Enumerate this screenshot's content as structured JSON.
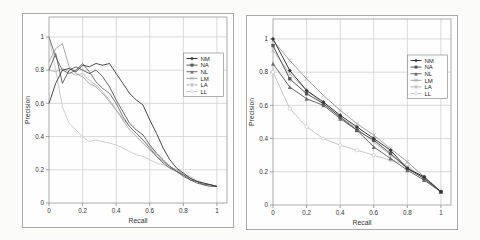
{
  "figure": {
    "background": "#fbfbfa",
    "panel_border_color": "#a8a8a8",
    "grid_color": "#c9c9c9",
    "frame_color": "#9a9a9a",
    "tick_color": "#8a8a8a",
    "text_color": "#333333",
    "legend_border_color": "#8f8f8f"
  },
  "chart_data": [
    {
      "id": "left-pr-chart",
      "type": "line",
      "title": "",
      "xlabel": "Recall",
      "ylabel": "Precision",
      "xlim": [
        0,
        1.06
      ],
      "ylim": [
        0,
        1.12
      ],
      "xticks": [
        0,
        0.2,
        0.4,
        0.6,
        0.8,
        1
      ],
      "yticks": [
        0,
        0.2,
        0.4,
        0.6,
        0.8,
        1
      ],
      "xtick_labels": [
        "0",
        "0.2",
        "0.4",
        "0.6",
        "0.8",
        "1"
      ],
      "ytick_labels": [
        "0",
        "0.2",
        "0.4",
        "0.6",
        "0.8",
        "1"
      ],
      "grid": true,
      "point_markers": false,
      "legend_position": "inside-right-upper",
      "series": [
        {
          "name": "NM",
          "color": "#383838",
          "marker": "diamond",
          "points": [
            [
              0,
              0.6
            ],
            [
              0.04,
              0.72
            ],
            [
              0.08,
              0.8
            ],
            [
              0.12,
              0.81
            ],
            [
              0.16,
              0.79
            ],
            [
              0.2,
              0.83
            ],
            [
              0.24,
              0.82
            ],
            [
              0.28,
              0.84
            ],
            [
              0.32,
              0.83
            ],
            [
              0.36,
              0.84
            ],
            [
              0.4,
              0.78
            ],
            [
              0.44,
              0.72
            ],
            [
              0.48,
              0.66
            ],
            [
              0.52,
              0.62
            ],
            [
              0.56,
              0.59
            ],
            [
              0.6,
              0.5
            ],
            [
              0.64,
              0.42
            ],
            [
              0.68,
              0.33
            ],
            [
              0.72,
              0.26
            ],
            [
              0.76,
              0.21
            ],
            [
              0.8,
              0.18
            ],
            [
              0.84,
              0.15
            ],
            [
              0.88,
              0.13
            ],
            [
              0.92,
              0.12
            ],
            [
              0.96,
              0.11
            ],
            [
              1,
              0.1
            ]
          ]
        },
        {
          "name": "NA",
          "color": "#575757",
          "marker": "square",
          "points": [
            [
              0,
              0.8
            ],
            [
              0.04,
              0.9
            ],
            [
              0.08,
              0.72
            ],
            [
              0.12,
              0.8
            ],
            [
              0.16,
              0.82
            ],
            [
              0.2,
              0.8
            ],
            [
              0.24,
              0.78
            ],
            [
              0.28,
              0.8
            ],
            [
              0.32,
              0.76
            ],
            [
              0.36,
              0.7
            ],
            [
              0.4,
              0.62
            ],
            [
              0.44,
              0.55
            ],
            [
              0.48,
              0.48
            ],
            [
              0.52,
              0.44
            ],
            [
              0.56,
              0.41
            ],
            [
              0.6,
              0.35
            ],
            [
              0.64,
              0.3
            ],
            [
              0.68,
              0.26
            ],
            [
              0.72,
              0.22
            ],
            [
              0.76,
              0.19
            ],
            [
              0.8,
              0.17
            ],
            [
              0.84,
              0.14
            ],
            [
              0.88,
              0.13
            ],
            [
              0.92,
              0.11
            ],
            [
              0.96,
              0.11
            ],
            [
              1,
              0.1
            ]
          ]
        },
        {
          "name": "NL",
          "color": "#6b6b6b",
          "marker": "triangle",
          "points": [
            [
              0,
              1.0
            ],
            [
              0.04,
              0.88
            ],
            [
              0.08,
              0.8
            ],
            [
              0.12,
              0.78
            ],
            [
              0.16,
              0.8
            ],
            [
              0.2,
              0.84
            ],
            [
              0.24,
              0.79
            ],
            [
              0.28,
              0.73
            ],
            [
              0.32,
              0.69
            ],
            [
              0.36,
              0.66
            ],
            [
              0.4,
              0.6
            ],
            [
              0.44,
              0.52
            ],
            [
              0.48,
              0.46
            ],
            [
              0.52,
              0.42
            ],
            [
              0.56,
              0.38
            ],
            [
              0.6,
              0.33
            ],
            [
              0.64,
              0.28
            ],
            [
              0.68,
              0.24
            ],
            [
              0.72,
              0.21
            ],
            [
              0.76,
              0.19
            ],
            [
              0.8,
              0.16
            ],
            [
              0.84,
              0.14
            ],
            [
              0.88,
              0.12
            ],
            [
              0.92,
              0.11
            ],
            [
              0.96,
              0.1
            ],
            [
              1,
              0.1
            ]
          ]
        },
        {
          "name": "LM",
          "color": "#a2a2a2",
          "marker": "x",
          "points": [
            [
              0,
              0.85
            ],
            [
              0.04,
              0.93
            ],
            [
              0.08,
              0.96
            ],
            [
              0.12,
              0.82
            ],
            [
              0.16,
              0.78
            ],
            [
              0.2,
              0.76
            ],
            [
              0.24,
              0.72
            ],
            [
              0.28,
              0.7
            ],
            [
              0.32,
              0.66
            ],
            [
              0.36,
              0.61
            ],
            [
              0.4,
              0.56
            ],
            [
              0.44,
              0.5
            ],
            [
              0.48,
              0.44
            ],
            [
              0.52,
              0.4
            ],
            [
              0.56,
              0.36
            ],
            [
              0.6,
              0.32
            ],
            [
              0.64,
              0.28
            ],
            [
              0.68,
              0.25
            ],
            [
              0.72,
              0.22
            ],
            [
              0.76,
              0.2
            ],
            [
              0.8,
              0.17
            ],
            [
              0.84,
              0.15
            ],
            [
              0.88,
              0.13
            ],
            [
              0.92,
              0.12
            ],
            [
              0.96,
              0.11
            ],
            [
              1,
              0.1
            ]
          ]
        },
        {
          "name": "LA",
          "color": "#b5b5b5",
          "marker": "asterisk",
          "points": [
            [
              0,
              0.8
            ],
            [
              0.04,
              0.79
            ],
            [
              0.08,
              0.81
            ],
            [
              0.12,
              0.79
            ],
            [
              0.16,
              0.77
            ],
            [
              0.2,
              0.78
            ],
            [
              0.24,
              0.74
            ],
            [
              0.28,
              0.71
            ],
            [
              0.32,
              0.67
            ],
            [
              0.36,
              0.62
            ],
            [
              0.4,
              0.56
            ],
            [
              0.44,
              0.51
            ],
            [
              0.48,
              0.46
            ],
            [
              0.52,
              0.42
            ],
            [
              0.56,
              0.38
            ],
            [
              0.6,
              0.34
            ],
            [
              0.64,
              0.29
            ],
            [
              0.68,
              0.25
            ],
            [
              0.72,
              0.22
            ],
            [
              0.76,
              0.19
            ],
            [
              0.8,
              0.17
            ],
            [
              0.84,
              0.15
            ],
            [
              0.88,
              0.13
            ],
            [
              0.92,
              0.11
            ],
            [
              0.96,
              0.1
            ],
            [
              1,
              0.1
            ]
          ]
        },
        {
          "name": "LL",
          "color": "#c9c9c9",
          "marker": "circle",
          "points": [
            [
              0,
              1.0
            ],
            [
              0.04,
              0.8
            ],
            [
              0.08,
              0.58
            ],
            [
              0.12,
              0.48
            ],
            [
              0.16,
              0.44
            ],
            [
              0.2,
              0.4
            ],
            [
              0.24,
              0.37
            ],
            [
              0.28,
              0.38
            ],
            [
              0.32,
              0.37
            ],
            [
              0.36,
              0.36
            ],
            [
              0.4,
              0.35
            ],
            [
              0.44,
              0.33
            ],
            [
              0.48,
              0.31
            ],
            [
              0.52,
              0.29
            ],
            [
              0.56,
              0.28
            ],
            [
              0.6,
              0.26
            ],
            [
              0.64,
              0.24
            ],
            [
              0.68,
              0.23
            ],
            [
              0.72,
              0.21
            ],
            [
              0.76,
              0.2
            ],
            [
              0.8,
              0.18
            ],
            [
              0.84,
              0.16
            ],
            [
              0.88,
              0.14
            ],
            [
              0.92,
              0.12
            ],
            [
              0.96,
              0.11
            ],
            [
              1,
              0.1
            ]
          ]
        }
      ]
    },
    {
      "id": "right-pr-chart",
      "type": "line",
      "title": "",
      "xlabel": "Recall",
      "ylabel": "Precision",
      "xlim": [
        0,
        1.06
      ],
      "ylim": [
        0,
        1.12
      ],
      "xticks": [
        0,
        0.2,
        0.4,
        0.6,
        0.8,
        1
      ],
      "yticks": [
        0,
        0.2,
        0.4,
        0.6,
        0.8,
        1
      ],
      "xtick_labels": [
        "0",
        "0.2",
        "0.4",
        "0.6",
        "0.8",
        "1"
      ],
      "ytick_labels": [
        "0",
        "0.2",
        "0.4",
        "0.6",
        "0.8",
        "1"
      ],
      "grid": true,
      "point_markers": true,
      "legend_position": "inside-right-upper",
      "series": [
        {
          "name": "NM",
          "color": "#383838",
          "marker": "diamond",
          "points": [
            [
              0,
              1.0
            ],
            [
              0.1,
              0.81
            ],
            [
              0.2,
              0.69
            ],
            [
              0.3,
              0.62
            ],
            [
              0.4,
              0.54
            ],
            [
              0.5,
              0.47
            ],
            [
              0.6,
              0.4
            ],
            [
              0.7,
              0.33
            ],
            [
              0.8,
              0.22
            ],
            [
              0.9,
              0.17
            ],
            [
              1,
              0.08
            ]
          ]
        },
        {
          "name": "NA",
          "color": "#575757",
          "marker": "square",
          "points": [
            [
              0,
              0.96
            ],
            [
              0.1,
              0.76
            ],
            [
              0.2,
              0.67
            ],
            [
              0.3,
              0.61
            ],
            [
              0.4,
              0.53
            ],
            [
              0.5,
              0.45
            ],
            [
              0.6,
              0.39
            ],
            [
              0.7,
              0.31
            ],
            [
              0.8,
              0.22
            ],
            [
              0.9,
              0.16
            ],
            [
              1,
              0.08
            ]
          ]
        },
        {
          "name": "NL",
          "color": "#6b6b6b",
          "marker": "triangle",
          "points": [
            [
              0,
              0.85
            ],
            [
              0.1,
              0.71
            ],
            [
              0.2,
              0.64
            ],
            [
              0.3,
              0.6
            ],
            [
              0.4,
              0.52
            ],
            [
              0.5,
              0.45
            ],
            [
              0.6,
              0.35
            ],
            [
              0.7,
              0.28
            ],
            [
              0.8,
              0.21
            ],
            [
              0.9,
              0.15
            ],
            [
              1,
              0.08
            ]
          ]
        },
        {
          "name": "LM",
          "color": "#a2a2a2",
          "marker": "x",
          "points": [
            [
              0,
              0.99
            ],
            [
              0.1,
              0.87
            ],
            [
              0.2,
              0.76
            ],
            [
              0.3,
              0.66
            ],
            [
              0.4,
              0.57
            ],
            [
              0.5,
              0.49
            ],
            [
              0.6,
              0.42
            ],
            [
              0.7,
              0.34
            ],
            [
              0.8,
              0.26
            ],
            [
              0.9,
              0.17
            ],
            [
              1,
              0.08
            ]
          ]
        },
        {
          "name": "LA",
          "color": "#b5b5b5",
          "marker": "asterisk",
          "points": [
            [
              0,
              0.93
            ],
            [
              0.1,
              0.79
            ],
            [
              0.2,
              0.69
            ],
            [
              0.3,
              0.61
            ],
            [
              0.4,
              0.53
            ],
            [
              0.5,
              0.46
            ],
            [
              0.6,
              0.38
            ],
            [
              0.7,
              0.3
            ],
            [
              0.8,
              0.23
            ],
            [
              0.9,
              0.16
            ],
            [
              1,
              0.08
            ]
          ]
        },
        {
          "name": "LL",
          "color": "#c9c9c9",
          "marker": "circle",
          "points": [
            [
              0,
              0.8
            ],
            [
              0.1,
              0.58
            ],
            [
              0.2,
              0.47
            ],
            [
              0.3,
              0.4
            ],
            [
              0.4,
              0.36
            ],
            [
              0.5,
              0.33
            ],
            [
              0.6,
              0.3
            ],
            [
              0.7,
              0.27
            ],
            [
              0.8,
              0.24
            ],
            [
              0.9,
              0.15
            ],
            [
              1,
              0.08
            ]
          ]
        }
      ]
    }
  ]
}
